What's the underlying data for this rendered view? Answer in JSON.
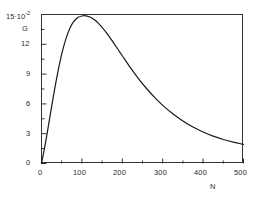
{
  "chart_data": {
    "type": "line",
    "title": "",
    "xlabel": "N",
    "ylabel": "G",
    "y_unit_label": "15·10",
    "y_unit_exponent": "-2",
    "xlim": [
      0,
      500
    ],
    "ylim": [
      0,
      0.15
    ],
    "grid": false,
    "legend": "none",
    "x_ticks": [
      0,
      100,
      200,
      300,
      400,
      500
    ],
    "x_tick_labels": [
      "0",
      "100",
      "200",
      "300",
      "400",
      "500"
    ],
    "x_minor_step": 50,
    "y_ticks": [
      0,
      0.03,
      0.06,
      0.09,
      0.12,
      0.15
    ],
    "y_tick_labels": [
      "0",
      "3",
      "6",
      "9",
      "12",
      "15·10⁻²"
    ],
    "y_minor_step": 0.015,
    "series": [
      {
        "name": "G(N)",
        "color": "#1a1a1a",
        "x": [
          0,
          10,
          20,
          30,
          40,
          50,
          60,
          70,
          80,
          90,
          100,
          110,
          120,
          130,
          140,
          150,
          160,
          175,
          190,
          200,
          220,
          240,
          260,
          280,
          300,
          325,
          350,
          375,
          400,
          425,
          450,
          475,
          500
        ],
        "y": [
          0.0,
          0.021,
          0.045,
          0.069,
          0.091,
          0.11,
          0.125,
          0.136,
          0.143,
          0.147,
          0.1485,
          0.1487,
          0.1475,
          0.145,
          0.1415,
          0.137,
          0.132,
          0.1235,
          0.1145,
          0.1085,
          0.0965,
          0.0855,
          0.0755,
          0.0665,
          0.0585,
          0.05,
          0.0428,
          0.0367,
          0.0317,
          0.0275,
          0.0242,
          0.0215,
          0.0192
        ]
      }
    ],
    "annotations": []
  },
  "axes": {
    "frame": {
      "left": 41,
      "top": 14,
      "right": 243,
      "bottom": 163
    },
    "frame_color": "#333333"
  },
  "labels": {
    "x_axis_title": "N",
    "y_axis_title": "G",
    "y_top_mantissa": "15·10",
    "y_top_exponent": "-2",
    "y_12": "12",
    "y_9": "9",
    "y_6": "6",
    "y_3": "3",
    "y_0": "0",
    "x_0": "0",
    "x_100": "100",
    "x_200": "200",
    "x_300": "300",
    "x_400": "400",
    "x_500": "500"
  }
}
